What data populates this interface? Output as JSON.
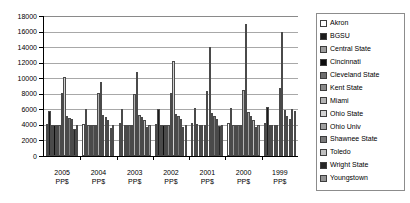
{
  "chart_data": {
    "type": "bar",
    "title": "",
    "xlabel": "",
    "ylabel": "",
    "ylim": [
      0,
      18000
    ],
    "ytick_step": 2000,
    "yticks": [
      "18000",
      "16000",
      "14000",
      "12000",
      "10000",
      "8000",
      "6000",
      "4000",
      "2000",
      "0"
    ],
    "grid": true,
    "legend_position": "right",
    "categories": [
      "2005 PP$",
      "2004 PP$",
      "2003 PP$",
      "2002 PP$",
      "2001 PP$",
      "2000 PP$",
      "1999 PP$"
    ],
    "category_lines": [
      [
        "2005",
        "PP$"
      ],
      [
        "2004",
        "PP$"
      ],
      [
        "2003",
        "PP$"
      ],
      [
        "2002",
        "PP$"
      ],
      [
        "2001",
        "PP$"
      ],
      [
        "2000",
        "PP$"
      ],
      [
        "1999",
        "PP$"
      ]
    ],
    "series": [
      {
        "name": "Akron",
        "color": "#ffffff",
        "values": [
          4150,
          4100,
          4200,
          4150,
          4250,
          4300,
          4200
        ]
      },
      {
        "name": "BGSU",
        "color": "#1c1c1c",
        "values": [
          5800,
          6000,
          6050,
          6100,
          6150,
          6200,
          6250
        ]
      },
      {
        "name": "Central State",
        "color": "#9c9c9c",
        "values": [
          4050,
          4050,
          4000,
          4050,
          4100,
          4000,
          4050
        ]
      },
      {
        "name": "Cincinnati",
        "color": "#0d0d0d",
        "values": [
          4000,
          4050,
          4000,
          4000,
          4050,
          4050,
          4000
        ]
      },
      {
        "name": "Cleveland State",
        "color": "#6e6e6e",
        "values": [
          4000,
          4000,
          4000,
          4000,
          4000,
          4000,
          4000
        ]
      },
      {
        "name": "Kent State",
        "color": "#8a8a8a",
        "values": [
          4000,
          4000,
          4000,
          4000,
          4000,
          4000,
          4000
        ]
      },
      {
        "name": "Miami",
        "color": "#b4b4b4",
        "values": [
          8050,
          8050,
          7950,
          8050,
          8300,
          8450,
          8700
        ]
      },
      {
        "name": "Ohio State",
        "color": "#d2d2d2",
        "values": [
          10100,
          9550,
          10750,
          12250,
          14000,
          17000,
          16000
        ]
      },
      {
        "name": "Ohio Univ",
        "color": "#a0a0a0",
        "values": [
          5150,
          5300,
          5300,
          5400,
          5550,
          5700,
          5900
        ]
      },
      {
        "name": "Shawnee State",
        "color": "#7a7a7a",
        "values": [
          4900,
          5000,
          5000,
          5100,
          5100,
          5150,
          5200
        ]
      },
      {
        "name": "Toledo",
        "color": "#c0c0c0",
        "values": [
          4700,
          4600,
          4650,
          4700,
          4700,
          4600,
          4700
        ]
      },
      {
        "name": "Wright State",
        "color": "#262626",
        "values": [
          3450,
          3550,
          3700,
          3700,
          3800,
          3700,
          6000
        ]
      },
      {
        "name": "Youngstown",
        "color": "#949494",
        "values": [
          4050,
          4050,
          4050,
          4050,
          4050,
          4050,
          5750
        ]
      }
    ]
  },
  "legend": {
    "items": [
      "Akron",
      "BGSU",
      "Central State",
      "Cincinnati",
      "Cleveland State",
      "Kent State",
      "Miami",
      "Ohio State",
      "Ohio Univ",
      "Shawnee State",
      "Toledo",
      "Wright State",
      "Youngstown"
    ]
  }
}
